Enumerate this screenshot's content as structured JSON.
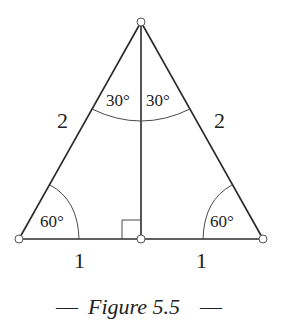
{
  "figure": {
    "caption_dash_left": "—",
    "caption_text": "Figure 5.5",
    "caption_dash_right": "—",
    "side_labels": {
      "left_hypotenuse": "2",
      "right_hypotenuse": "2",
      "left_base": "1",
      "right_base": "1"
    },
    "angle_labels": {
      "top_left": "30°",
      "top_right": "30°",
      "bottom_left": "60°",
      "bottom_right": "60°"
    },
    "right_angle_marker": true
  }
}
